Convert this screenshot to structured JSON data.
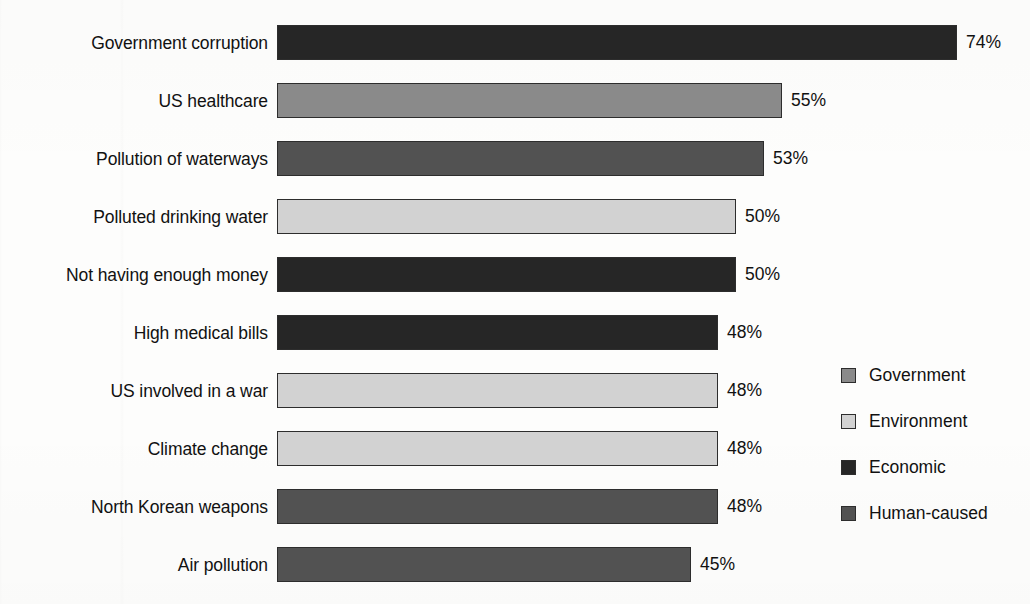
{
  "chart_data": {
    "type": "bar",
    "orientation": "horizontal",
    "title": "",
    "subtitle": "",
    "xlabel": "",
    "ylabel": "",
    "xlim": [
      0,
      74
    ],
    "grid": false,
    "value_suffix": "%",
    "legend_position": "right",
    "categories": [
      "Government corruption",
      "US healthcare",
      "Pollution of waterways",
      "Polluted drinking water",
      "Not having enough money",
      "High medical bills",
      "US involved in a war",
      "Climate change",
      "North Korean weapons",
      "Air pollution"
    ],
    "values": [
      74,
      55,
      53,
      50,
      50,
      48,
      48,
      48,
      48,
      45
    ],
    "value_labels": [
      "74%",
      "55%",
      "53%",
      "50%",
      "50%",
      "48%",
      "48%",
      "48%",
      "48%",
      "45%"
    ],
    "groups": [
      "Economic",
      "Government",
      "Human-caused",
      "Environment",
      "Economic",
      "Economic",
      "Environment",
      "Environment",
      "Human-caused",
      "Human-caused"
    ],
    "legend": [
      {
        "label": "Government",
        "color": "#8a8a8a"
      },
      {
        "label": "Environment",
        "color": "#d2d2d2"
      },
      {
        "label": "Economic",
        "color": "#262626"
      },
      {
        "label": "Human-caused",
        "color": "#525252"
      }
    ],
    "bar_colors": [
      "#262626",
      "#8a8a8a",
      "#525252",
      "#d2d2d2",
      "#262626",
      "#262626",
      "#d2d2d2",
      "#d2d2d2",
      "#525252",
      "#525252"
    ]
  }
}
